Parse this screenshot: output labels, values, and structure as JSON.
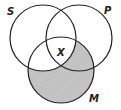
{
  "diagram": {
    "type": "venn-3",
    "circles": [
      {
        "id": "S",
        "label": "S",
        "cx": 43,
        "cy": 38,
        "r": 33
      },
      {
        "id": "P",
        "label": "P",
        "cx": 79,
        "cy": 38,
        "r": 33
      },
      {
        "id": "M",
        "label": "M",
        "cx": 61,
        "cy": 70,
        "r": 33
      }
    ],
    "shaded_region": "M minus S",
    "marker": {
      "label": "x",
      "region": "S ∩ P ∩ M"
    },
    "colors": {
      "stroke": "#222222",
      "shade": "#bdbdbd",
      "background": "#ffffff"
    }
  },
  "labels": {
    "s": "S",
    "p": "P",
    "m": "M",
    "x": "X"
  }
}
